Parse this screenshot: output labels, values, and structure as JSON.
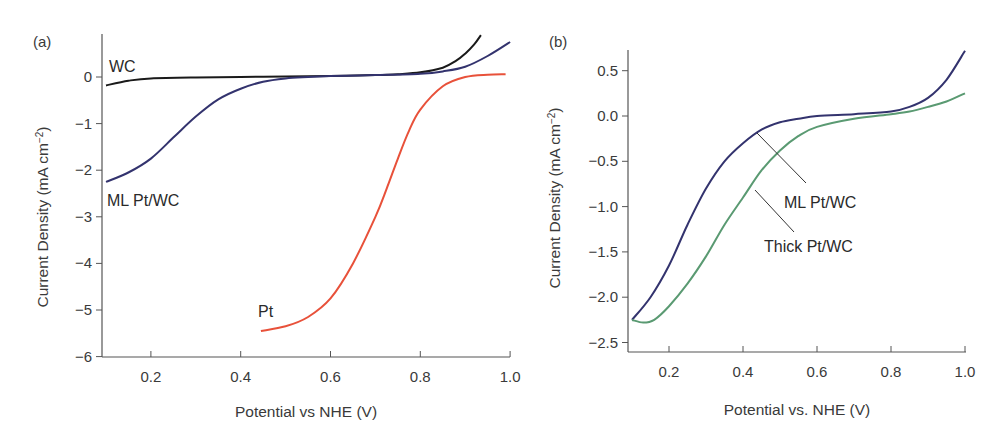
{
  "chart_data": [
    {
      "type": "line",
      "panel": "(a)",
      "xlabel": "Potential vs NHE (V)",
      "ylabel": "Current Density (mA cm⁻²)",
      "xlim": [
        0.1,
        1.0
      ],
      "ylim": [
        -6,
        0.8
      ],
      "xticks": [
        0.2,
        0.4,
        0.6,
        0.8,
        1.0
      ],
      "xtick_labels": [
        "0.2",
        "0.4",
        "0.6",
        "0.8",
        "1.0"
      ],
      "yticks": [
        0,
        -1,
        -2,
        -3,
        -4,
        -5,
        -6
      ],
      "ytick_labels": [
        "0",
        "−1",
        "−2",
        "−3",
        "−4",
        "−5",
        "−6"
      ],
      "grid": false,
      "legend": "inline labels",
      "series": [
        {
          "name": "WC",
          "color": "#1a1a1a",
          "x": [
            0.1,
            0.15,
            0.2,
            0.3,
            0.4,
            0.5,
            0.6,
            0.7,
            0.75,
            0.8,
            0.85,
            0.88,
            0.9,
            0.92,
            0.935
          ],
          "y": [
            -0.18,
            -0.08,
            -0.03,
            -0.01,
            0.0,
            0.01,
            0.02,
            0.04,
            0.06,
            0.1,
            0.2,
            0.35,
            0.5,
            0.7,
            0.9
          ]
        },
        {
          "name": "ML Pt/WC",
          "color": "#33336e",
          "x": [
            0.1,
            0.15,
            0.2,
            0.25,
            0.3,
            0.35,
            0.4,
            0.45,
            0.5,
            0.55,
            0.6,
            0.7,
            0.8,
            0.85,
            0.9,
            0.95,
            1.0
          ],
          "y": [
            -2.25,
            -2.05,
            -1.75,
            -1.3,
            -0.85,
            -0.48,
            -0.25,
            -0.1,
            -0.03,
            0.0,
            0.02,
            0.04,
            0.07,
            0.12,
            0.22,
            0.45,
            0.75
          ]
        },
        {
          "name": "Pt",
          "color": "#e8513a",
          "x": [
            0.445,
            0.5,
            0.55,
            0.6,
            0.65,
            0.7,
            0.725,
            0.75,
            0.775,
            0.8,
            0.85,
            0.9,
            0.95,
            0.99
          ],
          "y": [
            -5.45,
            -5.35,
            -5.15,
            -4.75,
            -4.0,
            -3.0,
            -2.4,
            -1.75,
            -1.15,
            -0.7,
            -0.2,
            0.0,
            0.05,
            0.06
          ]
        }
      ],
      "annotations": [
        "WC",
        "ML Pt/WC",
        "Pt"
      ]
    },
    {
      "type": "line",
      "panel": "(b)",
      "xlabel": "Potential vs. NHE (V)",
      "ylabel": "Current Density (mA cm⁻²)",
      "xlim": [
        0.1,
        1.0
      ],
      "ylim": [
        -2.6,
        0.75
      ],
      "xticks": [
        0.2,
        0.4,
        0.6,
        0.8,
        1.0
      ],
      "xtick_labels": [
        "0.2",
        "0.4",
        "0.6",
        "0.8",
        "1.0"
      ],
      "yticks": [
        0.5,
        0.0,
        -0.5,
        -1.0,
        -1.5,
        -2.0,
        -2.5
      ],
      "ytick_labels": [
        "0.5",
        "0.0",
        "−0.5",
        "−1.0",
        "−1.5",
        "−2.0",
        "−2.5"
      ],
      "grid": false,
      "legend": "inline labels with leader lines",
      "series": [
        {
          "name": "ML Pt/WC",
          "color": "#33336e",
          "x": [
            0.1,
            0.15,
            0.2,
            0.25,
            0.3,
            0.35,
            0.4,
            0.45,
            0.5,
            0.55,
            0.6,
            0.7,
            0.8,
            0.85,
            0.9,
            0.95,
            1.0
          ],
          "y": [
            -2.25,
            -2.0,
            -1.65,
            -1.2,
            -0.8,
            -0.5,
            -0.3,
            -0.15,
            -0.07,
            -0.03,
            0.0,
            0.02,
            0.05,
            0.1,
            0.2,
            0.4,
            0.72
          ]
        },
        {
          "name": "Thick Pt/WC",
          "color": "#5a9a72",
          "x": [
            0.1,
            0.13,
            0.16,
            0.2,
            0.25,
            0.3,
            0.35,
            0.4,
            0.45,
            0.5,
            0.55,
            0.6,
            0.7,
            0.8,
            0.85,
            0.9,
            0.95,
            1.0
          ],
          "y": [
            -2.25,
            -2.28,
            -2.25,
            -2.1,
            -1.85,
            -1.55,
            -1.2,
            -0.9,
            -0.6,
            -0.38,
            -0.22,
            -0.12,
            -0.03,
            0.02,
            0.05,
            0.1,
            0.16,
            0.25
          ]
        }
      ],
      "annotations": [
        "ML Pt/WC",
        "Thick Pt/WC"
      ]
    }
  ],
  "panels": {
    "a": {
      "label": "(a)",
      "ylabel_main": "Current Density (mA cm",
      "ylabel_sup": "−2",
      "ylabel_end": ")",
      "xlabel": "Potential vs NHE (V)",
      "series_labels": {
        "wc": "WC",
        "ml": "ML Pt/WC",
        "pt": "Pt"
      }
    },
    "b": {
      "label": "(b)",
      "ylabel_main": "Current Density (mA cm",
      "ylabel_sup": "−2",
      "ylabel_end": ")",
      "xlabel": "Potential vs. NHE (V)",
      "series_labels": {
        "ml": "ML Pt/WC",
        "thick": "Thick Pt/WC"
      }
    }
  }
}
